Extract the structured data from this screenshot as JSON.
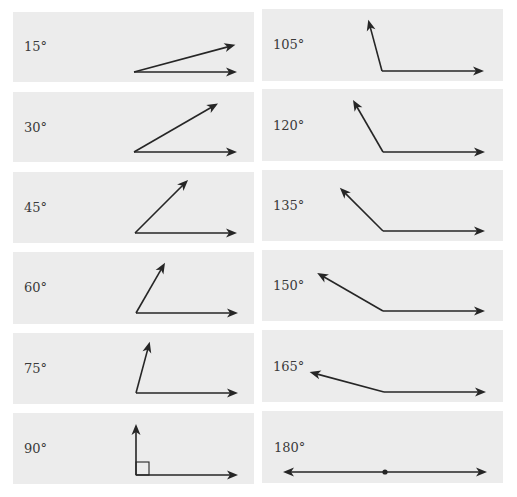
{
  "figure": {
    "colors": {
      "panel_bg": "#ececec",
      "line": "#262626",
      "label": "#3a3a3a"
    },
    "panels": [
      {
        "label": "15°",
        "degrees": 15,
        "column": "left",
        "box": [
          13,
          12,
          241,
          70
        ],
        "label_pos": [
          24,
          40
        ],
        "vertex": [
          134,
          72
        ],
        "ray_len": 105,
        "base_len": 103
      },
      {
        "label": "30°",
        "degrees": 30,
        "column": "left",
        "box": [
          13,
          92,
          241,
          70
        ],
        "label_pos": [
          24,
          121
        ],
        "vertex": [
          134,
          152
        ],
        "ray_len": 97,
        "base_len": 103
      },
      {
        "label": "45°",
        "degrees": 45,
        "column": "left",
        "box": [
          13,
          172,
          241,
          71
        ],
        "label_pos": [
          24,
          201
        ],
        "vertex": [
          135,
          233
        ],
        "ray_len": 75,
        "base_len": 102
      },
      {
        "label": "60°",
        "degrees": 60,
        "column": "left",
        "box": [
          13,
          252,
          241,
          72
        ],
        "label_pos": [
          24,
          281
        ],
        "vertex": [
          136,
          313
        ],
        "ray_len": 58,
        "base_len": 102
      },
      {
        "label": "75°",
        "degrees": 75,
        "column": "left",
        "box": [
          13,
          333,
          241,
          71
        ],
        "label_pos": [
          24,
          362
        ],
        "vertex": [
          136,
          393
        ],
        "ray_len": 53,
        "base_len": 102
      },
      {
        "label": "90°",
        "degrees": 90,
        "column": "left",
        "box": [
          13,
          413,
          241,
          71
        ],
        "label_pos": [
          24,
          442
        ],
        "vertex": [
          136,
          475
        ],
        "ray_len": 51,
        "base_len": 102,
        "right_angle_marker": 13
      },
      {
        "label": "105°",
        "degrees": 105,
        "column": "right",
        "box": [
          262,
          9,
          241,
          72
        ],
        "label_pos": [
          273,
          38
        ],
        "vertex": [
          382,
          71
        ],
        "ray_len": 53,
        "base_len": 102
      },
      {
        "label": "120°",
        "degrees": 120,
        "column": "right",
        "box": [
          262,
          89,
          241,
          72
        ],
        "label_pos": [
          273,
          119
        ],
        "vertex": [
          383,
          152
        ],
        "ray_len": 60,
        "base_len": 102
      },
      {
        "label": "135°",
        "degrees": 135,
        "column": "right",
        "box": [
          262,
          170,
          241,
          71
        ],
        "label_pos": [
          273,
          199
        ],
        "vertex": [
          383,
          231
        ],
        "ray_len": 61,
        "base_len": 102
      },
      {
        "label": "150°",
        "degrees": 150,
        "column": "right",
        "box": [
          262,
          250,
          241,
          71
        ],
        "label_pos": [
          273,
          279
        ],
        "vertex": [
          383,
          311
        ],
        "ray_len": 76,
        "base_len": 102
      },
      {
        "label": "165°",
        "degrees": 165,
        "column": "right",
        "box": [
          262,
          330,
          241,
          72
        ],
        "label_pos": [
          273,
          360
        ],
        "vertex": [
          384,
          392
        ],
        "ray_len": 77,
        "base_len": 102
      },
      {
        "label": "180°",
        "degrees": 180,
        "column": "right",
        "box": [
          262,
          411,
          241,
          72
        ],
        "label_pos": [
          274,
          441
        ],
        "vertex": [
          385,
          472
        ],
        "ray_len": 102,
        "base_len": 102,
        "vertex_dot": true
      }
    ]
  }
}
